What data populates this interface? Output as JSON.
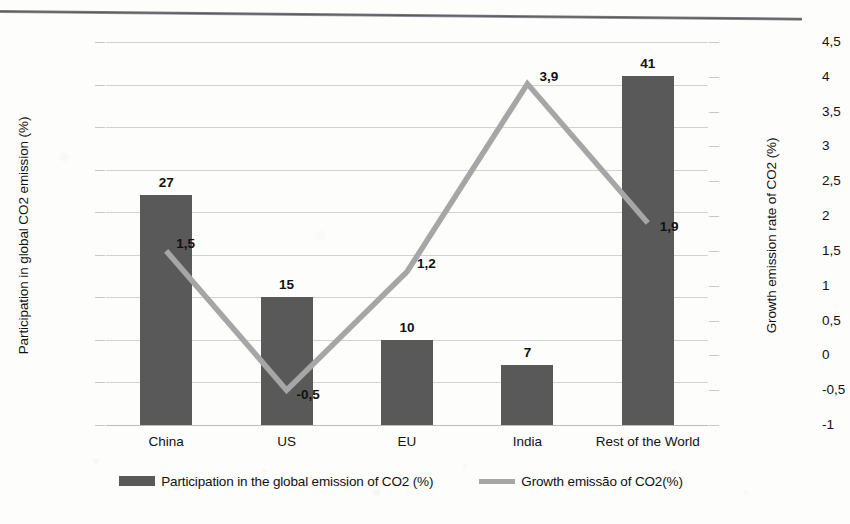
{
  "chart_data": {
    "type": "bar",
    "title": "",
    "subtitle": "",
    "categories": [
      "China",
      "US",
      "EU",
      "India",
      "Rest of the World"
    ],
    "series": [
      {
        "name": "Participation in the global emission of CO2 (%)",
        "type": "bar",
        "axis": "left",
        "values": [
          27,
          15,
          10,
          7,
          41
        ],
        "value_labels": [
          "27",
          "15",
          "10",
          "7",
          "41"
        ],
        "color": "#595959"
      },
      {
        "name": "Growth emissão of CO2(%)",
        "type": "line",
        "axis": "right",
        "values": [
          1.5,
          -0.5,
          1.2,
          3.9,
          1.9
        ],
        "value_labels": [
          "1,5",
          "-0,5",
          "1,2",
          "3,9",
          "1,9"
        ],
        "color": "#a6a6a6"
      }
    ],
    "xlabel": "",
    "ylabel": "Participation in global CO2 emission (%)",
    "y2label": "Growth emission rate of CO2 (%)",
    "ylim": [
      0,
      45
    ],
    "y2lim": [
      -1,
      4.5
    ],
    "yticks": [
      "0",
      "5",
      "10",
      "15",
      "20",
      "25",
      "30",
      "35",
      "40",
      "45"
    ],
    "y2ticks": [
      "-1",
      "-0,5",
      "0",
      "0,5",
      "1",
      "1,5",
      "2",
      "2,5",
      "3",
      "3,5",
      "4",
      "4,5"
    ],
    "grid": true,
    "legend_position": "bottom"
  },
  "axes": {
    "left_title": "Participation in global CO2 emission (%)",
    "right_title": "Growth emission rate of CO2 (%)"
  },
  "legend": {
    "items": [
      {
        "label": "Participation in the global emission of CO2 (%)",
        "marker": "bar-swatch",
        "color": "#595959"
      },
      {
        "label": "Growth emissão of CO2(%)",
        "marker": "line-swatch",
        "color": "#a6a6a6"
      }
    ]
  },
  "colors": {
    "bar": "#595959",
    "line": "#a6a6a6",
    "grid": "#d2d2d2",
    "text": "#111111",
    "page": "#fdfdfc"
  }
}
